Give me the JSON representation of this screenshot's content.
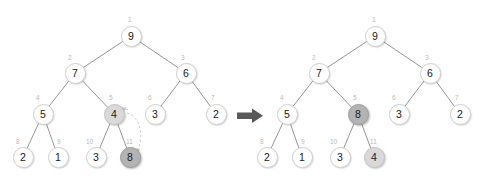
{
  "figure": {
    "kind": "binary-heap-swap-diagram",
    "background_color": "#ffffff",
    "node_fill_default": "#ffffff",
    "node_fill_light": "#d9d9d9",
    "node_fill_dark": "#b3b3b3",
    "edge_color": "#8a8a8a",
    "index_label_color": "#b9b9b9",
    "transition_arrow_color": "#595959",
    "dashed_arrow_color": "#cccccc"
  },
  "transition_arrow": {
    "label": "becomes",
    "glyph": "right-arrow"
  },
  "trees": [
    {
      "id": "before",
      "name": "heap-before-swap",
      "origin_x": 0,
      "nodes": [
        {
          "index": "1",
          "value": "9",
          "x": 131,
          "y": 36,
          "shade": "none",
          "idx_x": 128,
          "idx_y": 17
        },
        {
          "index": "2",
          "value": "7",
          "x": 75,
          "y": 73,
          "shade": "none",
          "idx_x": 68,
          "idx_y": 55
        },
        {
          "index": "3",
          "value": "6",
          "x": 186,
          "y": 73,
          "shade": "none",
          "idx_x": 181,
          "idx_y": 55
        },
        {
          "index": "4",
          "value": "5",
          "x": 43,
          "y": 114,
          "shade": "none",
          "idx_x": 36,
          "idx_y": 95
        },
        {
          "index": "5",
          "value": "4",
          "x": 114,
          "y": 114,
          "shade": "light",
          "idx_x": 109,
          "idx_y": 95
        },
        {
          "index": "6",
          "value": "3",
          "x": 155,
          "y": 114,
          "shade": "none",
          "idx_x": 148,
          "idx_y": 95
        },
        {
          "index": "7",
          "value": "2",
          "x": 216,
          "y": 114,
          "shade": "none",
          "idx_x": 211,
          "idx_y": 95
        },
        {
          "index": "8",
          "value": "2",
          "x": 23,
          "y": 157,
          "shade": "none",
          "idx_x": 16,
          "idx_y": 139
        },
        {
          "index": "9",
          "value": "1",
          "x": 58,
          "y": 157,
          "shade": "none",
          "idx_x": 57,
          "idx_y": 139
        },
        {
          "index": "10",
          "value": "3",
          "x": 96,
          "y": 157,
          "shade": "none",
          "idx_x": 86,
          "idx_y": 139
        },
        {
          "index": "11",
          "value": "8",
          "x": 130,
          "y": 157,
          "shade": "dark",
          "idx_x": 126,
          "idx_y": 139
        }
      ],
      "edges": [
        [
          131,
          36,
          75,
          73
        ],
        [
          131,
          36,
          186,
          73
        ],
        [
          75,
          73,
          43,
          114
        ],
        [
          75,
          73,
          114,
          114
        ],
        [
          186,
          73,
          155,
          114
        ],
        [
          186,
          73,
          216,
          114
        ],
        [
          43,
          114,
          23,
          157
        ],
        [
          43,
          114,
          58,
          157
        ],
        [
          114,
          114,
          96,
          157
        ],
        [
          114,
          114,
          130,
          157
        ]
      ],
      "swap_hint": {
        "type": "dashed-double-arrow",
        "from_value": "4",
        "to_value": "8",
        "path": "M 127 113 C 143 118 143 140 137 152"
      }
    },
    {
      "id": "after",
      "name": "heap-after-swap",
      "origin_x": 244,
      "nodes": [
        {
          "index": "1",
          "value": "9",
          "x": 131,
          "y": 36,
          "shade": "none",
          "idx_x": 128,
          "idx_y": 17
        },
        {
          "index": "2",
          "value": "7",
          "x": 75,
          "y": 73,
          "shade": "none",
          "idx_x": 68,
          "idx_y": 55
        },
        {
          "index": "3",
          "value": "6",
          "x": 186,
          "y": 73,
          "shade": "none",
          "idx_x": 181,
          "idx_y": 55
        },
        {
          "index": "4",
          "value": "5",
          "x": 43,
          "y": 114,
          "shade": "none",
          "idx_x": 36,
          "idx_y": 95
        },
        {
          "index": "5",
          "value": "8",
          "x": 114,
          "y": 114,
          "shade": "dark",
          "idx_x": 109,
          "idx_y": 95
        },
        {
          "index": "6",
          "value": "3",
          "x": 155,
          "y": 114,
          "shade": "none",
          "idx_x": 148,
          "idx_y": 95
        },
        {
          "index": "7",
          "value": "2",
          "x": 216,
          "y": 114,
          "shade": "none",
          "idx_x": 211,
          "idx_y": 95
        },
        {
          "index": "8",
          "value": "2",
          "x": 23,
          "y": 157,
          "shade": "none",
          "idx_x": 16,
          "idx_y": 139
        },
        {
          "index": "9",
          "value": "1",
          "x": 58,
          "y": 157,
          "shade": "none",
          "idx_x": 57,
          "idx_y": 139
        },
        {
          "index": "10",
          "value": "3",
          "x": 96,
          "y": 157,
          "shade": "none",
          "idx_x": 86,
          "idx_y": 139
        },
        {
          "index": "11",
          "value": "4",
          "x": 130,
          "y": 157,
          "shade": "light",
          "idx_x": 126,
          "idx_y": 139
        }
      ],
      "edges": [
        [
          131,
          36,
          75,
          73
        ],
        [
          131,
          36,
          186,
          73
        ],
        [
          75,
          73,
          43,
          114
        ],
        [
          75,
          73,
          114,
          114
        ],
        [
          186,
          73,
          155,
          114
        ],
        [
          186,
          73,
          216,
          114
        ],
        [
          43,
          114,
          23,
          157
        ],
        [
          43,
          114,
          58,
          157
        ],
        [
          114,
          114,
          96,
          157
        ],
        [
          114,
          114,
          130,
          157
        ]
      ],
      "swap_hint": null
    }
  ]
}
